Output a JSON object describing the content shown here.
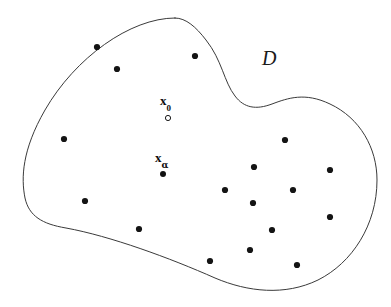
{
  "figure": {
    "width": 391,
    "height": 307,
    "background_color": "#ffffff",
    "boundary": {
      "name": "domain-boundary",
      "stroke_color": "#3a3a3a",
      "stroke_width": 1,
      "fill": "none",
      "path": "M 175 18 C 130 18, 75 58, 45 110 C 22 150, 21 178, 25 198 C 29 216, 42 224, 66 228 C 110 236, 170 258, 215 278 C 248 292, 285 296, 318 280 C 352 263, 377 225, 377 180 C 377 148, 360 118, 330 104 C 305 92, 288 98, 272 104 C 256 110, 244 108, 235 96 C 224 82, 222 60, 206 40 C 196 27, 186 18, 175 18 Z"
    },
    "region_label": {
      "name": "region-label-D",
      "text": "D",
      "x": 262,
      "y": 48
    },
    "annotated_points": [
      {
        "name": "point-x0",
        "label_text": "x",
        "label_subscript": "0",
        "label_x": 160,
        "label_y": 94,
        "marker_x": 168,
        "marker_y": 118,
        "marker_style": "hollow",
        "marker_radius": 2.6,
        "marker_color": "#1a1a1a"
      },
      {
        "name": "point-x-alpha",
        "label_text": "x",
        "label_subscript": "α",
        "label_x": 155,
        "label_y": 151,
        "marker_x": 163,
        "marker_y": 174,
        "marker_style": "filled",
        "marker_radius": 3.0,
        "marker_color": "#111111"
      }
    ],
    "sample_points": {
      "name": "sample-points",
      "color": "#141414",
      "radius": 3.1,
      "coordinates": [
        [
          97,
          47
        ],
        [
          117,
          69
        ],
        [
          195,
          56
        ],
        [
          64,
          139
        ],
        [
          285,
          140
        ],
        [
          254,
          167
        ],
        [
          330,
          170
        ],
        [
          225,
          190
        ],
        [
          293,
          190
        ],
        [
          253,
          203
        ],
        [
          85,
          201
        ],
        [
          330,
          217
        ],
        [
          272,
          230
        ],
        [
          139,
          229
        ],
        [
          250,
          250
        ],
        [
          210,
          261
        ],
        [
          297,
          265
        ]
      ]
    }
  }
}
